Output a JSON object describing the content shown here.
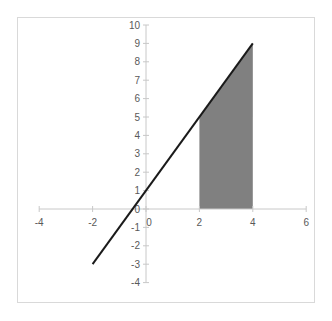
{
  "chart_data": {
    "type": "line",
    "title": "",
    "xlabel": "",
    "ylabel": "",
    "xlim": [
      -4,
      6
    ],
    "ylim": [
      -4,
      10
    ],
    "grid": false,
    "legend": null,
    "x_ticks": [
      -4,
      -2,
      0,
      2,
      4,
      6
    ],
    "x_tick_labels": [
      "-4",
      "-2",
      "0",
      "2",
      "4",
      "6"
    ],
    "y_ticks": [
      -4,
      -3,
      -2,
      -1,
      0,
      1,
      2,
      3,
      4,
      5,
      6,
      7,
      8,
      9,
      10
    ],
    "y_tick_labels": [
      "-4",
      "-3",
      "-2",
      "-1",
      "0",
      "1",
      "2",
      "3",
      "4",
      "5",
      "6",
      "7",
      "8",
      "9",
      "10"
    ],
    "series": [
      {
        "name": "y = 2x + 1",
        "type": "line",
        "color": "#1a1a1a",
        "x": [
          -2,
          4
        ],
        "y": [
          -3,
          9
        ]
      },
      {
        "name": "shaded area",
        "type": "area",
        "color": "#808080",
        "x": [
          2,
          2,
          4,
          4
        ],
        "y": [
          0,
          5,
          9,
          0
        ]
      }
    ],
    "annotations": []
  },
  "colors": {
    "axis": "#c8c8c8",
    "label": "#595959",
    "line": "#1a1a1a",
    "fill": "#808080",
    "frame": "#d9d9d9"
  }
}
